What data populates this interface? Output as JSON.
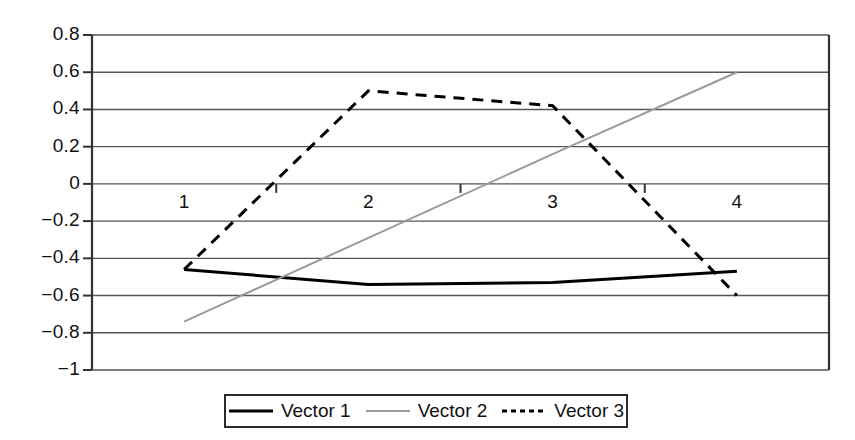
{
  "chart_data": {
    "type": "line",
    "title": "",
    "xlabel": "",
    "ylabel": "",
    "categories": [
      "1",
      "2",
      "3",
      "4"
    ],
    "ylim": [
      -1,
      0.8
    ],
    "ytick_labels": [
      "0.8",
      "0.6",
      "0.4",
      "0.2",
      "0",
      "−0.2",
      "−0.4",
      "−0.6",
      "−0.8",
      "−1"
    ],
    "ytick_values": [
      0.8,
      0.6,
      0.4,
      0.2,
      0,
      -0.2,
      -0.4,
      -0.6,
      -0.8,
      -1
    ],
    "grid": true,
    "legend_position": "bottom",
    "series": [
      {
        "name": "Vector 1",
        "values": [
          -0.46,
          -0.54,
          -0.53,
          -0.47
        ],
        "color": "#000000",
        "style": "solid",
        "width": 3
      },
      {
        "name": "Vector 2",
        "values": [
          -0.74,
          -0.29,
          0.16,
          0.6
        ],
        "color": "#9a9a9a",
        "style": "solid",
        "width": 2
      },
      {
        "name": "Vector 3",
        "values": [
          -0.46,
          0.5,
          0.42,
          -0.6
        ],
        "color": "#000000",
        "style": "dashed",
        "width": 3
      }
    ]
  },
  "axis": {
    "gridline_color": "#555555",
    "frame_color": "#333333"
  },
  "legend": {
    "items": [
      {
        "label": "Vector 1"
      },
      {
        "label": "Vector 2"
      },
      {
        "label": "Vector 3"
      }
    ]
  }
}
